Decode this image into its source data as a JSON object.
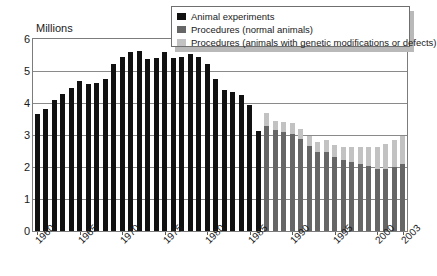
{
  "chart_data": {
    "type": "bar",
    "subtype": "stacked-bar",
    "title": "",
    "xlabel": "",
    "ylabel": "Millions",
    "ylim": [
      0,
      6
    ],
    "ytick_labels": [
      "0",
      "1",
      "2",
      "3",
      "4",
      "5",
      "6"
    ],
    "ytick_values": [
      0,
      1,
      2,
      3,
      4,
      5,
      6
    ],
    "grid": true,
    "grid_axis": "y",
    "legend_position": "top-right",
    "xtick_labels": [
      "1960",
      "1965",
      "1970",
      "1975",
      "1980",
      "1985",
      "1990",
      "1995",
      "2000",
      "2003"
    ],
    "xtick_years": [
      1960,
      1965,
      1970,
      1975,
      1980,
      1985,
      1990,
      1995,
      2000,
      2003
    ],
    "x": [
      1960,
      1961,
      1962,
      1963,
      1964,
      1965,
      1966,
      1967,
      1968,
      1969,
      1970,
      1971,
      1972,
      1973,
      1974,
      1975,
      1976,
      1977,
      1978,
      1979,
      1980,
      1981,
      1982,
      1983,
      1984,
      1985,
      1986,
      1987,
      1988,
      1989,
      1990,
      1991,
      1992,
      1993,
      1994,
      1995,
      1996,
      1997,
      1998,
      1999,
      2000,
      2001,
      2002,
      2003
    ],
    "series": [
      {
        "name": "Animal experiments",
        "color": "#111111",
        "values": [
          3.65,
          3.8,
          4.1,
          4.28,
          4.47,
          4.69,
          4.58,
          4.63,
          4.76,
          5.22,
          5.44,
          5.58,
          5.62,
          5.38,
          5.42,
          5.58,
          5.42,
          5.44,
          5.52,
          5.45,
          5.22,
          4.75,
          4.42,
          4.35,
          4.25,
          3.93,
          3.11,
          null,
          null,
          null,
          null,
          null,
          null,
          null,
          null,
          null,
          null,
          null,
          null,
          null,
          null,
          null,
          null,
          null
        ]
      },
      {
        "name": "Procedures (normal animals)",
        "color": "#666666",
        "values": [
          null,
          null,
          null,
          null,
          null,
          null,
          null,
          null,
          null,
          null,
          null,
          null,
          null,
          null,
          null,
          null,
          null,
          null,
          null,
          null,
          null,
          null,
          null,
          null,
          null,
          null,
          null,
          3.28,
          3.15,
          3.1,
          3.02,
          2.88,
          2.65,
          2.48,
          2.48,
          2.32,
          2.22,
          2.15,
          2.08,
          2.02,
          1.95,
          1.93,
          1.99,
          2.1
        ]
      },
      {
        "name": "Procedures (animals with genetic modifications or defects)",
        "color": "#c2c2c2",
        "values": [
          null,
          null,
          null,
          null,
          null,
          null,
          null,
          null,
          null,
          null,
          null,
          null,
          null,
          null,
          null,
          null,
          null,
          null,
          null,
          null,
          null,
          null,
          null,
          null,
          null,
          null,
          null,
          0.42,
          0.28,
          0.32,
          0.35,
          0.3,
          0.32,
          0.3,
          0.36,
          0.38,
          0.42,
          0.48,
          0.55,
          0.62,
          0.68,
          0.78,
          0.85,
          0.88
        ]
      }
    ]
  },
  "legend": {
    "items": [
      {
        "label": "Animal experiments",
        "color": "#111111"
      },
      {
        "label": "Procedures (normal animals)",
        "color": "#666666"
      },
      {
        "label": "Procedures (animals with genetic modifications or defects)",
        "color": "#c2c2c2"
      }
    ]
  }
}
